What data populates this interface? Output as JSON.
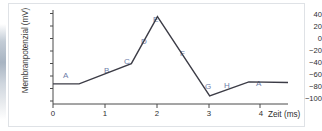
{
  "chart_data": {
    "type": "line",
    "title": "",
    "subtitle": "",
    "xlabel": "Zeit (ms)",
    "ylabel": "Membranpotenzial (mV)",
    "xlim": [
      0,
      4.5
    ],
    "ylim": [
      -100,
      40
    ],
    "xticks": [
      0,
      1,
      2,
      3,
      4
    ],
    "xticklabels": [
      "0",
      "1",
      "2",
      "3",
      "4"
    ],
    "yticks": [
      40,
      20,
      0,
      -20,
      -40,
      -60,
      -80,
      -100
    ],
    "yticklabels": [
      "40",
      "20",
      "0",
      "−20",
      "−40",
      "−60",
      "−80",
      "−100"
    ],
    "grid": false,
    "legend": null,
    "series": [
      {
        "name": "Aktionspotenzial",
        "color": "#3c3c46",
        "x": [
          0.0,
          0.5,
          1.5,
          2.0,
          3.0,
          3.75,
          4.5
        ],
        "y": [
          -70,
          -70,
          -40,
          30,
          -88,
          -67,
          -68
        ]
      }
    ],
    "annotations": [
      {
        "label": "A",
        "x": 0.22,
        "y": -57,
        "data_x": 0.25,
        "data_y": -70
      },
      {
        "label": "B",
        "x": 1.02,
        "y": -47,
        "data_x": 1.0,
        "data_y": -55
      },
      {
        "label": "C",
        "x": 1.4,
        "y": -30,
        "data_x": 1.5,
        "data_y": -40
      },
      {
        "label": "D",
        "x": 1.72,
        "y": 3,
        "data_x": 1.78,
        "data_y": -8
      },
      {
        "label": "E",
        "x": 1.96,
        "y": 39,
        "data_x": 2.0,
        "data_y": 30
      },
      {
        "label": "F",
        "x": 2.48,
        "y": -19,
        "data_x": 2.5,
        "data_y": -29
      },
      {
        "label": "G",
        "x": 2.96,
        "y": -65,
        "data_x": 3.0,
        "data_y": -88
      },
      {
        "label": "H",
        "x": 3.33,
        "y": -64,
        "data_x": 3.35,
        "data_y": -78
      },
      {
        "label": "A",
        "x": 3.96,
        "y": -62,
        "data_x": 4.0,
        "data_y": -68
      }
    ]
  },
  "colors": {
    "line": "#3c3c46",
    "annotation": "#6c7ca8",
    "axis": "#4a4a4a",
    "tick_text": "#2e2e2e",
    "border": "#dfe2e6",
    "background": "#ffffff"
  }
}
